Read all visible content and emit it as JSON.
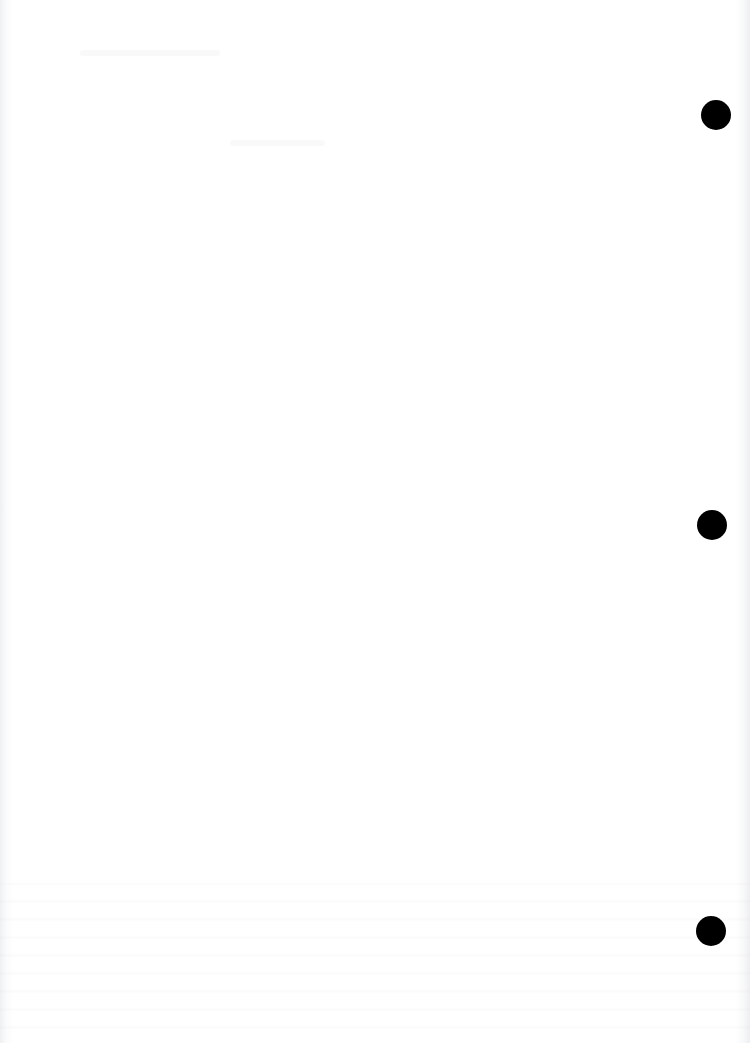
{
  "page": {
    "background": "#ffffff",
    "hole_color": "#000000",
    "holes": [
      {
        "x": 701,
        "y": 100
      },
      {
        "x": 697,
        "y": 510
      },
      {
        "x": 696,
        "y": 916
      }
    ]
  }
}
